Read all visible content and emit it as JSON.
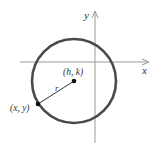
{
  "diagram": {
    "labels": {
      "x_axis": "x",
      "y_axis": "y",
      "center": "(h, k)",
      "radius": "r",
      "point": "(x, y)"
    },
    "colors": {
      "circle": "#4a4a4a",
      "axes": "#9a9a9a",
      "radius_line": "#333333",
      "points": "#111111",
      "text": "#333333"
    },
    "geometry": {
      "center_px": [
        74,
        81
      ],
      "radius_px": 42,
      "point_px": [
        38,
        104
      ],
      "x_axis_y": 62,
      "y_axis_x": 95
    }
  }
}
